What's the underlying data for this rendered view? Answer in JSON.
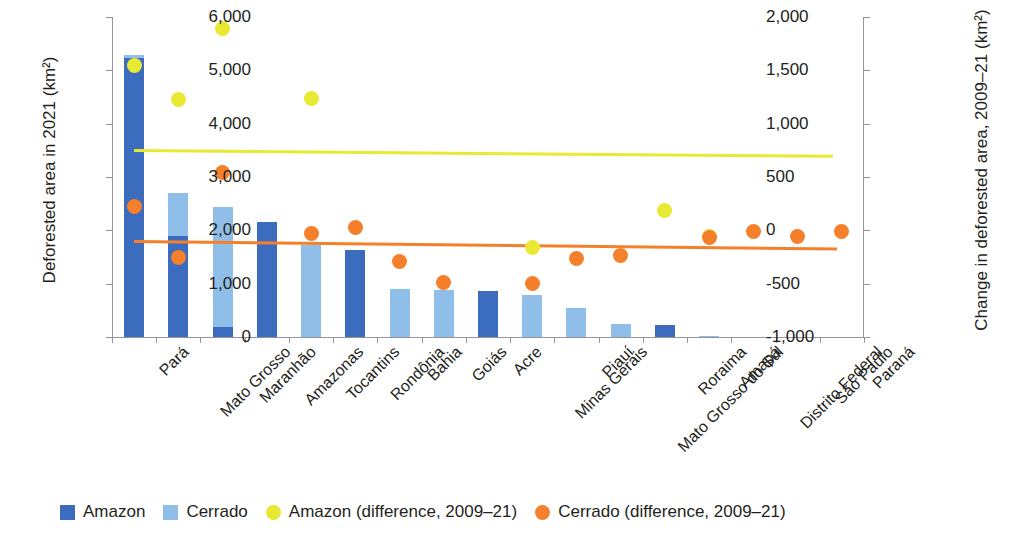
{
  "chart_data": {
    "type": "bar",
    "title": "",
    "subtitle": "",
    "ylabel": "Deforested area in 2021 (km²)",
    "y2label": "Change in deforested area, 2009–21 (km²)",
    "xlabel": "",
    "grid": false,
    "legend_position": "bottom",
    "ylim": [
      0,
      6000
    ],
    "y2lim": [
      -1000,
      2000
    ],
    "yticks": [
      "0",
      "1,000",
      "2,000",
      "3,000",
      "4,000",
      "5,000",
      "6,000"
    ],
    "ytick_values": [
      0,
      1000,
      2000,
      3000,
      4000,
      5000,
      6000
    ],
    "y2ticks": [
      "-1,000",
      "-500",
      "0",
      "500",
      "1,000",
      "1,500",
      "2,000"
    ],
    "y2tick_values": [
      -1000,
      -500,
      0,
      500,
      1000,
      1500,
      2000
    ],
    "categories": [
      "Pará",
      "Mato Grosso",
      "Maranhão",
      "Amazonas",
      "Tocantins",
      "Rondônia",
      "Bahia",
      "Goiás",
      "Acre",
      "Minas Gerais",
      "Piauí",
      "Mato Grosso do Sul",
      "Roraima",
      "Amapá",
      "Distrito Federal",
      "São Paulo",
      "Paraná"
    ],
    "series": [
      {
        "name": "Amazon",
        "kind": "bar-stack",
        "color": "#3b6cbe",
        "values": [
          5225,
          1900,
          180,
          2150,
          0,
          1640,
          0,
          0,
          860,
          0,
          0,
          0,
          225,
          0,
          0,
          0,
          0
        ]
      },
      {
        "name": "Cerrado",
        "kind": "bar-stack",
        "color": "#8fbfe8",
        "values": [
          60,
          800,
          2250,
          0,
          1720,
          0,
          900,
          890,
          0,
          790,
          550,
          250,
          0,
          20,
          0,
          0,
          0
        ]
      },
      {
        "name": "Amazon (difference, 2009–21)",
        "kind": "scatter",
        "axis": "right",
        "color": "#e9e832",
        "values": [
          1550,
          1225,
          1890,
          null,
          1240,
          null,
          null,
          null,
          null,
          -160,
          null,
          null,
          190,
          -55,
          null,
          null,
          null
        ]
      },
      {
        "name": "Cerrado (difference, 2009–21)",
        "kind": "scatter",
        "axis": "right",
        "color": "#f5802b",
        "values": [
          220,
          -250,
          545,
          null,
          -30,
          25,
          -290,
          -490,
          null,
          -500,
          -265,
          -235,
          null,
          -70,
          -15,
          -60,
          -15
        ]
      }
    ],
    "trend_lines": [
      {
        "name": "Amazon trend",
        "color": "#e9e832",
        "axis": "right",
        "x_start_index": 0,
        "x_end_index": 15.8,
        "y_start": 760,
        "y_end": 705
      },
      {
        "name": "Cerrado trend",
        "color": "#f5802b",
        "axis": "right",
        "x_start_index": 0,
        "x_end_index": 15.9,
        "y_start": -95,
        "y_end": -165
      }
    ]
  },
  "legend": {
    "items": [
      {
        "label": "Amazon",
        "marker": "square",
        "color": "#3b6cbe"
      },
      {
        "label": "Cerrado",
        "marker": "square",
        "color": "#8fbfe8"
      },
      {
        "label": "Amazon (difference, 2009–21)",
        "marker": "circle",
        "color": "#e9e832"
      },
      {
        "label": "Cerrado (difference, 2009–21)",
        "marker": "circle",
        "color": "#f5802b"
      }
    ]
  }
}
